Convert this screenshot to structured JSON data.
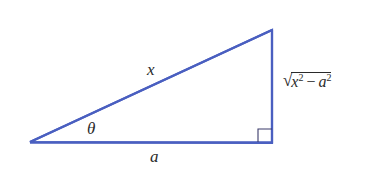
{
  "diagram": {
    "type": "right-triangle",
    "stroke_color": "#4a5fc0",
    "right_angle_marker_color": "#3a3a6a",
    "vertices": {
      "left": [
        30,
        142
      ],
      "top_right": [
        272,
        30
      ],
      "bottom_right": [
        272,
        143
      ]
    },
    "labels": {
      "hypotenuse": "x",
      "angle": "θ",
      "adjacent": "a",
      "opposite": {
        "radical": "√",
        "term1_base": "x",
        "term1_exp": "2",
        "operator": "−",
        "term2_base": "a",
        "term2_exp": "2"
      }
    }
  }
}
